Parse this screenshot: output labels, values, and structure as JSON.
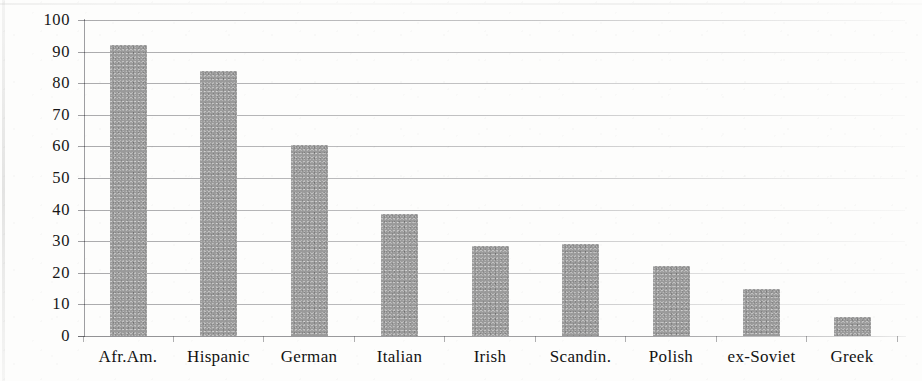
{
  "chart_data": {
    "type": "bar",
    "title": "",
    "xlabel": "",
    "ylabel": "",
    "ylim": [
      0,
      100
    ],
    "ytick_step": 10,
    "grid": true,
    "legend": false,
    "orientation": "vertical",
    "bar_color": "#9a9a9a",
    "categories": [
      "Afr.Am.",
      "Hispanic",
      "German",
      "Italian",
      "Irish",
      "Scandin.",
      "Polish",
      "ex-Soviet",
      "Greek"
    ],
    "values": [
      92,
      84,
      60.5,
      38.5,
      28.5,
      29,
      22,
      15,
      6
    ],
    "ytick_labels": [
      "100",
      "90",
      "80",
      "70",
      "60",
      "50",
      "40",
      "30",
      "20",
      "10",
      "0"
    ],
    "ytick_values": [
      100,
      90,
      80,
      70,
      60,
      50,
      40,
      30,
      20,
      10,
      0
    ]
  }
}
